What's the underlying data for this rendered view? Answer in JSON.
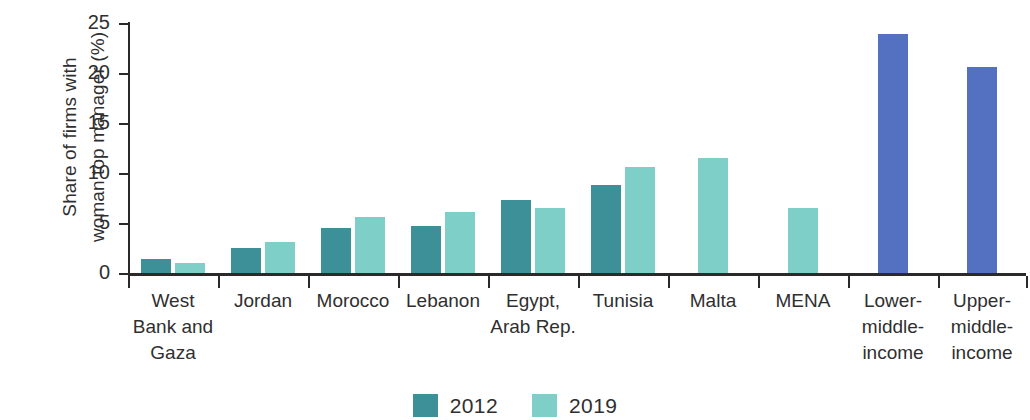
{
  "chart_data": {
    "type": "bar",
    "title": "",
    "subtitle": "",
    "xlabel": "",
    "ylabel": "Share of firms with\nwoman top manager (%)",
    "ylim": [
      0,
      25
    ],
    "ytick_values": [
      0,
      5,
      10,
      15,
      20,
      25
    ],
    "ytick_labels": [
      "0",
      "5",
      "10",
      "15",
      "20",
      "25"
    ],
    "grid": false,
    "legend_position": "bottom-center",
    "categories": [
      "West\nBank and\nGaza",
      "Jordan",
      "Morocco",
      "Lebanon",
      "Egypt,\nArab Rep.",
      "Tunisia",
      "Malta",
      "MENA",
      "Lower-\nmiddle-\nincome",
      "Upper-\nmiddle-\nincome"
    ],
    "series": [
      {
        "name": "2012",
        "color": "#3d9097",
        "values": [
          1.4,
          2.5,
          4.5,
          4.7,
          7.3,
          8.8,
          null,
          null,
          null,
          null
        ]
      },
      {
        "name": "2019",
        "color": "#7fcfc9",
        "values": [
          1.0,
          3.1,
          5.6,
          6.1,
          6.5,
          10.6,
          11.5,
          6.5,
          null,
          null
        ]
      },
      {
        "name": "income-group",
        "color": "#5470c0",
        "values": [
          null,
          null,
          null,
          null,
          null,
          null,
          null,
          null,
          23.9,
          20.6
        ]
      }
    ]
  },
  "legend": {
    "items": [
      {
        "label": "2012",
        "color": "#3d9097"
      },
      {
        "label": "2019",
        "color": "#7fcfc9"
      }
    ]
  },
  "colors": {
    "series_2012": "#3d9097",
    "series_2019": "#7fcfc9",
    "income_group": "#5470c0",
    "axis": "#2a2a2a",
    "text": "#2f2f2f",
    "background": "#ffffff"
  }
}
